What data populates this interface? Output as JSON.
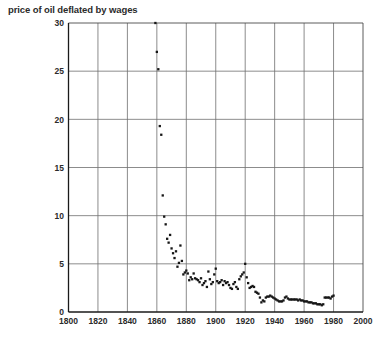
{
  "chart_data": {
    "type": "scatter",
    "title": "price of oil deflated by wages",
    "xlabel": "",
    "ylabel": "",
    "xlim": [
      1800,
      2000
    ],
    "ylim": [
      0,
      30
    ],
    "xticks": [
      1800,
      1820,
      1840,
      1860,
      1880,
      1900,
      1920,
      1940,
      1960,
      1980,
      2000
    ],
    "xticklabels": [
      "1800",
      "1820",
      "1840",
      "1860",
      "1880",
      "1900",
      "1920",
      "1940",
      "1960",
      "1980",
      "2000"
    ],
    "yticks": [
      0,
      5,
      10,
      15,
      20,
      25,
      30
    ],
    "yticklabels": [
      "0",
      "5",
      "10",
      "15",
      "20",
      "25",
      "30"
    ],
    "grid": true,
    "legend": null,
    "marker": "square",
    "marker_color": "#161616",
    "points": [
      [
        1859,
        30.0
      ],
      [
        1860,
        27.0
      ],
      [
        1861,
        25.2
      ],
      [
        1862,
        19.3
      ],
      [
        1863,
        18.4
      ],
      [
        1864,
        12.1
      ],
      [
        1865,
        9.9
      ],
      [
        1866,
        9.1
      ],
      [
        1867,
        7.6
      ],
      [
        1868,
        7.2
      ],
      [
        1869,
        8.0
      ],
      [
        1870,
        6.6
      ],
      [
        1871,
        6.1
      ],
      [
        1872,
        5.6
      ],
      [
        1873,
        6.3
      ],
      [
        1874,
        4.7
      ],
      [
        1875,
        5.1
      ],
      [
        1876,
        6.9
      ],
      [
        1877,
        5.3
      ],
      [
        1878,
        3.9
      ],
      [
        1879,
        4.1
      ],
      [
        1880,
        4.3
      ],
      [
        1881,
        4.0
      ],
      [
        1882,
        3.3
      ],
      [
        1883,
        3.6
      ],
      [
        1884,
        3.4
      ],
      [
        1885,
        4.0
      ],
      [
        1886,
        3.5
      ],
      [
        1887,
        3.4
      ],
      [
        1888,
        3.3
      ],
      [
        1889,
        3.1
      ],
      [
        1890,
        3.5
      ],
      [
        1891,
        2.8
      ],
      [
        1892,
        3.0
      ],
      [
        1893,
        3.2
      ],
      [
        1894,
        2.6
      ],
      [
        1895,
        4.2
      ],
      [
        1896,
        3.4
      ],
      [
        1897,
        2.9
      ],
      [
        1898,
        3.1
      ],
      [
        1899,
        3.9
      ],
      [
        1900,
        4.5
      ],
      [
        1901,
        3.2
      ],
      [
        1902,
        3.0
      ],
      [
        1903,
        3.1
      ],
      [
        1904,
        3.3
      ],
      [
        1905,
        2.8
      ],
      [
        1906,
        3.2
      ],
      [
        1907,
        3.0
      ],
      [
        1908,
        3.1
      ],
      [
        1909,
        2.8
      ],
      [
        1910,
        2.5
      ],
      [
        1911,
        2.4
      ],
      [
        1912,
        2.9
      ],
      [
        1913,
        3.1
      ],
      [
        1914,
        2.6
      ],
      [
        1915,
        2.4
      ],
      [
        1916,
        3.4
      ],
      [
        1917,
        3.7
      ],
      [
        1918,
        3.9
      ],
      [
        1919,
        4.1
      ],
      [
        1920,
        5.0
      ],
      [
        1921,
        3.6
      ],
      [
        1922,
        3.0
      ],
      [
        1923,
        2.5
      ],
      [
        1924,
        2.6
      ],
      [
        1925,
        2.7
      ],
      [
        1926,
        2.6
      ],
      [
        1927,
        2.1
      ],
      [
        1928,
        2.0
      ],
      [
        1929,
        1.9
      ],
      [
        1930,
        1.5
      ],
      [
        1931,
        1.0
      ],
      [
        1932,
        1.2
      ],
      [
        1933,
        1.1
      ],
      [
        1934,
        1.5
      ],
      [
        1935,
        1.6
      ],
      [
        1936,
        1.6
      ],
      [
        1937,
        1.7
      ],
      [
        1938,
        1.6
      ],
      [
        1939,
        1.5
      ],
      [
        1940,
        1.4
      ],
      [
        1941,
        1.3
      ],
      [
        1942,
        1.2
      ],
      [
        1943,
        1.1
      ],
      [
        1944,
        1.1
      ],
      [
        1945,
        1.1
      ],
      [
        1946,
        1.2
      ],
      [
        1947,
        1.5
      ],
      [
        1948,
        1.6
      ],
      [
        1949,
        1.4
      ],
      [
        1950,
        1.3
      ],
      [
        1951,
        1.3
      ],
      [
        1952,
        1.3
      ],
      [
        1953,
        1.3
      ],
      [
        1954,
        1.3
      ],
      [
        1955,
        1.3
      ],
      [
        1956,
        1.2
      ],
      [
        1957,
        1.3
      ],
      [
        1958,
        1.2
      ],
      [
        1959,
        1.2
      ],
      [
        1960,
        1.1
      ],
      [
        1961,
        1.1
      ],
      [
        1962,
        1.1
      ],
      [
        1963,
        1.0
      ],
      [
        1964,
        1.0
      ],
      [
        1965,
        1.0
      ],
      [
        1966,
        0.9
      ],
      [
        1967,
        0.9
      ],
      [
        1968,
        0.9
      ],
      [
        1969,
        0.8
      ],
      [
        1970,
        0.8
      ],
      [
        1971,
        0.8
      ],
      [
        1972,
        0.7
      ],
      [
        1973,
        0.8
      ],
      [
        1974,
        1.5
      ],
      [
        1975,
        1.5
      ],
      [
        1976,
        1.5
      ],
      [
        1977,
        1.5
      ],
      [
        1978,
        1.4
      ],
      [
        1979,
        1.6
      ],
      [
        1980,
        1.7
      ]
    ]
  }
}
